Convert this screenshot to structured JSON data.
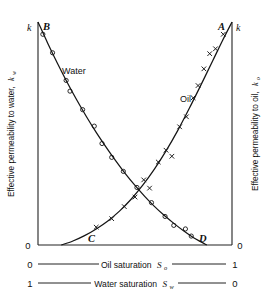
{
  "chart_data": {
    "type": "line",
    "title": "",
    "xlabel": "Oil saturation S_o",
    "ylabel": "Effective permeability to water, k_w",
    "ylabel_right": "Effective permeability to oil, k_o",
    "xlabel_secondary": "Water saturation S_w",
    "grid": false,
    "legend": "inline-labels",
    "xlim": [
      0,
      1
    ],
    "ylim": [
      0,
      1
    ],
    "axes": {
      "bottom_primary": {
        "label_text": "Oil saturation",
        "label_symbol": "S",
        "label_subscript": "o",
        "left_tick": "0",
        "right_tick": "1"
      },
      "bottom_secondary": {
        "label_text": "Water saturation",
        "label_symbol": "S",
        "label_subscript": "w",
        "left_tick": "1",
        "right_tick": "0"
      },
      "left": {
        "title_text": "Effective permeability to water,",
        "title_symbol": "k",
        "title_subscript": "w",
        "top_tick": "k",
        "bottom_tick": "0"
      },
      "right": {
        "title_text": "Effective permeability to oil,",
        "title_symbol": "k",
        "title_subscript": "o",
        "top_tick": "k",
        "bottom_tick": "0"
      }
    },
    "annotations": [
      {
        "name": "point-B",
        "text": "B",
        "x": 0.0,
        "y": 1.0
      },
      {
        "name": "point-A",
        "text": "A",
        "x": 1.0,
        "y": 1.0
      },
      {
        "name": "point-C",
        "text": "C",
        "x": 0.12,
        "y": 0.0
      },
      {
        "name": "point-D",
        "text": "D",
        "x": 0.87,
        "y": 0.0
      }
    ],
    "series": [
      {
        "name": "Water",
        "label": "Water",
        "marker": "circle",
        "curve_start": {
          "x": 0.0,
          "y": 1.0
        },
        "curve_end": {
          "x": 0.87,
          "y": 0.0
        },
        "curve": [
          [
            0.0,
            1.0
          ],
          [
            0.05,
            0.905
          ],
          [
            0.1,
            0.815
          ],
          [
            0.15,
            0.73
          ],
          [
            0.2,
            0.65
          ],
          [
            0.25,
            0.575
          ],
          [
            0.3,
            0.505
          ],
          [
            0.35,
            0.44
          ],
          [
            0.4,
            0.378
          ],
          [
            0.45,
            0.32
          ],
          [
            0.5,
            0.267
          ],
          [
            0.55,
            0.218
          ],
          [
            0.6,
            0.173
          ],
          [
            0.65,
            0.133
          ],
          [
            0.7,
            0.097
          ],
          [
            0.75,
            0.064
          ],
          [
            0.8,
            0.034
          ],
          [
            0.84,
            0.014
          ],
          [
            0.87,
            0.0
          ]
        ],
        "points": [
          [
            0.025,
            0.945
          ],
          [
            0.075,
            0.862
          ],
          [
            0.145,
            0.738
          ],
          [
            0.165,
            0.69
          ],
          [
            0.23,
            0.607
          ],
          [
            0.29,
            0.533
          ],
          [
            0.33,
            0.455
          ],
          [
            0.38,
            0.393
          ],
          [
            0.44,
            0.33
          ],
          [
            0.51,
            0.258
          ],
          [
            0.585,
            0.19
          ],
          [
            0.655,
            0.128
          ],
          [
            0.7,
            0.088
          ],
          [
            0.76,
            0.072
          ],
          [
            0.79,
            0.04
          ]
        ]
      },
      {
        "name": "Oil",
        "label": "Oil",
        "marker": "cross",
        "curve_start": {
          "x": 0.12,
          "y": 0.0
        },
        "curve_end": {
          "x": 1.0,
          "y": 1.0
        },
        "curve": [
          [
            0.12,
            0.0
          ],
          [
            0.18,
            0.018
          ],
          [
            0.24,
            0.042
          ],
          [
            0.3,
            0.072
          ],
          [
            0.36,
            0.108
          ],
          [
            0.42,
            0.152
          ],
          [
            0.48,
            0.205
          ],
          [
            0.54,
            0.268
          ],
          [
            0.6,
            0.34
          ],
          [
            0.66,
            0.422
          ],
          [
            0.72,
            0.513
          ],
          [
            0.78,
            0.613
          ],
          [
            0.84,
            0.718
          ],
          [
            0.9,
            0.825
          ],
          [
            0.95,
            0.915
          ],
          [
            1.0,
            1.0
          ]
        ],
        "points": [
          [
            0.3,
            0.08
          ],
          [
            0.38,
            0.118
          ],
          [
            0.445,
            0.172
          ],
          [
            0.5,
            0.215
          ],
          [
            0.545,
            0.292
          ],
          [
            0.575,
            0.255
          ],
          [
            0.62,
            0.372
          ],
          [
            0.66,
            0.425
          ],
          [
            0.69,
            0.398
          ],
          [
            0.73,
            0.53
          ],
          [
            0.765,
            0.575
          ],
          [
            0.8,
            0.66
          ],
          [
            0.825,
            0.715
          ],
          [
            0.855,
            0.79
          ],
          [
            0.885,
            0.858
          ],
          [
            0.915,
            0.88
          ],
          [
            0.955,
            0.945
          ]
        ]
      }
    ]
  }
}
